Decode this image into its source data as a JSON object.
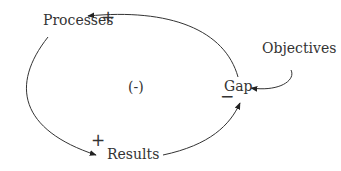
{
  "diagram": {
    "type": "causal-loop",
    "loop_polarity": "(-)",
    "nodes": {
      "processes": "Processes",
      "results": "Results",
      "gap": "Gap",
      "objectives": "Objectives"
    },
    "links": [
      {
        "from": "Gap",
        "to": "Processes",
        "polarity": "+"
      },
      {
        "from": "Processes",
        "to": "Results",
        "polarity": "+"
      },
      {
        "from": "Results",
        "to": "Gap",
        "polarity": "−"
      },
      {
        "from": "Objectives",
        "to": "Gap",
        "polarity": ""
      }
    ],
    "signs": {
      "processes_plus": "+",
      "results_plus": "+",
      "gap_minus": "−"
    },
    "colors": {
      "line": "#333333",
      "background": "#ffffff"
    }
  }
}
